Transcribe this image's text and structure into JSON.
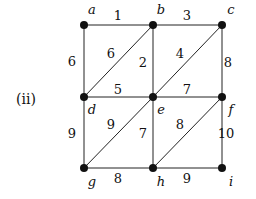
{
  "caption": "(ii)",
  "nodes": [
    {
      "id": "a",
      "x": 84,
      "y": 25,
      "lx": 92,
      "ly": 14
    },
    {
      "id": "b",
      "x": 153,
      "y": 25,
      "lx": 161,
      "ly": 14
    },
    {
      "id": "c",
      "x": 222,
      "y": 25,
      "lx": 231,
      "ly": 14
    },
    {
      "id": "d",
      "x": 84,
      "y": 97,
      "lx": 92,
      "ly": 114
    },
    {
      "id": "e",
      "x": 153,
      "y": 97,
      "lx": 161,
      "ly": 114
    },
    {
      "id": "f",
      "x": 222,
      "y": 97,
      "lx": 231,
      "ly": 114
    },
    {
      "id": "g",
      "x": 84,
      "y": 168,
      "lx": 92,
      "ly": 186
    },
    {
      "id": "h",
      "x": 153,
      "y": 168,
      "lx": 161,
      "ly": 186
    },
    {
      "id": "i",
      "x": 222,
      "y": 168,
      "lx": 231,
      "ly": 186
    }
  ],
  "edges": [
    {
      "from": "a",
      "to": "b",
      "weight": "1",
      "lx": 118,
      "ly": 20
    },
    {
      "from": "b",
      "to": "c",
      "weight": "3",
      "lx": 187,
      "ly": 20
    },
    {
      "from": "a",
      "to": "d",
      "weight": "6",
      "lx": 72,
      "ly": 66
    },
    {
      "from": "b",
      "to": "d",
      "weight": "6",
      "lx": 111,
      "ly": 58
    },
    {
      "from": "b",
      "to": "e",
      "weight": "2",
      "lx": 143,
      "ly": 67
    },
    {
      "from": "e",
      "to": "c",
      "weight": "4",
      "lx": 180,
      "ly": 58
    },
    {
      "from": "c",
      "to": "f",
      "weight": "8",
      "lx": 228,
      "ly": 67
    },
    {
      "from": "d",
      "to": "e",
      "weight": "5",
      "lx": 118,
      "ly": 94
    },
    {
      "from": "e",
      "to": "f",
      "weight": "7",
      "lx": 187,
      "ly": 94
    },
    {
      "from": "d",
      "to": "g",
      "weight": "9",
      "lx": 72,
      "ly": 138
    },
    {
      "from": "e",
      "to": "g",
      "weight": "9",
      "lx": 111,
      "ly": 129
    },
    {
      "from": "e",
      "to": "h",
      "weight": "7",
      "lx": 143,
      "ly": 138
    },
    {
      "from": "h",
      "to": "f",
      "weight": "8",
      "lx": 180,
      "ly": 129
    },
    {
      "from": "f",
      "to": "i",
      "weight": "10",
      "lx": 226,
      "ly": 138
    },
    {
      "from": "g",
      "to": "h",
      "weight": "8",
      "lx": 118,
      "ly": 183
    },
    {
      "from": "h",
      "to": "i",
      "weight": "9",
      "lx": 187,
      "ly": 183
    }
  ]
}
